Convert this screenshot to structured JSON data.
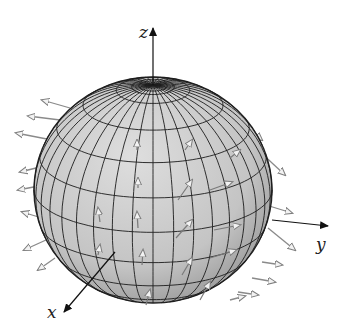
{
  "figure": {
    "type": "3d-vector-field-on-sphere",
    "sphere": {
      "center": [
        153,
        190
      ],
      "rx": 119,
      "ry": 113,
      "fill": "#c9c9c9",
      "grid_color": "#1a1a1a",
      "meridians": 36,
      "parallels": 10,
      "view_tilt_deg": 22
    },
    "axes": {
      "z": {
        "label": "z",
        "from": [
          153,
          85
        ],
        "to": [
          153,
          28
        ],
        "label_pos": [
          139,
          38
        ]
      },
      "y": {
        "label": "y",
        "from": [
          272,
          220
        ],
        "to": [
          328,
          226
        ],
        "label_pos": [
          316,
          250
        ]
      },
      "x": {
        "label": "x",
        "from": [
          115,
          252
        ],
        "to": [
          64,
          312
        ],
        "label_pos": [
          47,
          318
        ]
      }
    },
    "arrow_color": "#8a8a8a",
    "axis_color": "#111111"
  }
}
